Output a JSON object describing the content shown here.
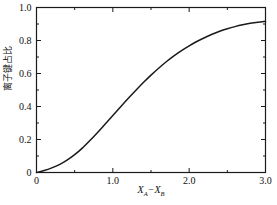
{
  "chart_data": {
    "type": "line",
    "title": "",
    "subtitle": "",
    "xlabel": "XA−XB",
    "xlabel_parts": {
      "symbol1": "X",
      "sub1": "A",
      "operator": "−",
      "symbol2": "X",
      "sub2": "B"
    },
    "ylabel": "离子键占比",
    "xlim": [
      0,
      3.0
    ],
    "ylim": [
      0,
      1.0
    ],
    "grid": false,
    "legend": null,
    "xticks": [
      0,
      1.0,
      2.0,
      3.0
    ],
    "xticklabels": [
      "0",
      "1.0",
      "2.0",
      "3.0"
    ],
    "xminorticks": [
      0.5,
      1.5,
      2.5
    ],
    "yticks": [
      0,
      0.2,
      0.4,
      0.6,
      0.8,
      1.0
    ],
    "yticklabels": [
      "0",
      "0.2",
      "0.4",
      "0.6",
      "0.8",
      "1.0"
    ],
    "yminorticks": [
      0.1,
      0.3,
      0.5,
      0.7,
      0.9
    ],
    "line_color": "#1a1a1a",
    "line_width": 1.5,
    "x": [
      0.0,
      0.1,
      0.2,
      0.3,
      0.4,
      0.5,
      0.6,
      0.7,
      0.8,
      0.9,
      1.0,
      1.1,
      1.2,
      1.3,
      1.4,
      1.5,
      1.6,
      1.7,
      1.8,
      1.9,
      2.0,
      2.1,
      2.2,
      2.3,
      2.4,
      2.5,
      2.6,
      2.7,
      2.8,
      2.9,
      3.0
    ],
    "values": [
      0.0,
      0.012,
      0.028,
      0.048,
      0.075,
      0.108,
      0.148,
      0.194,
      0.243,
      0.294,
      0.345,
      0.397,
      0.448,
      0.497,
      0.545,
      0.59,
      0.632,
      0.671,
      0.707,
      0.739,
      0.768,
      0.794,
      0.817,
      0.838,
      0.856,
      0.871,
      0.884,
      0.895,
      0.904,
      0.911,
      0.916
    ]
  },
  "axes": {
    "frame_color": "#1a1a1a",
    "frame_width": 1.2,
    "tick_direction": "in"
  }
}
